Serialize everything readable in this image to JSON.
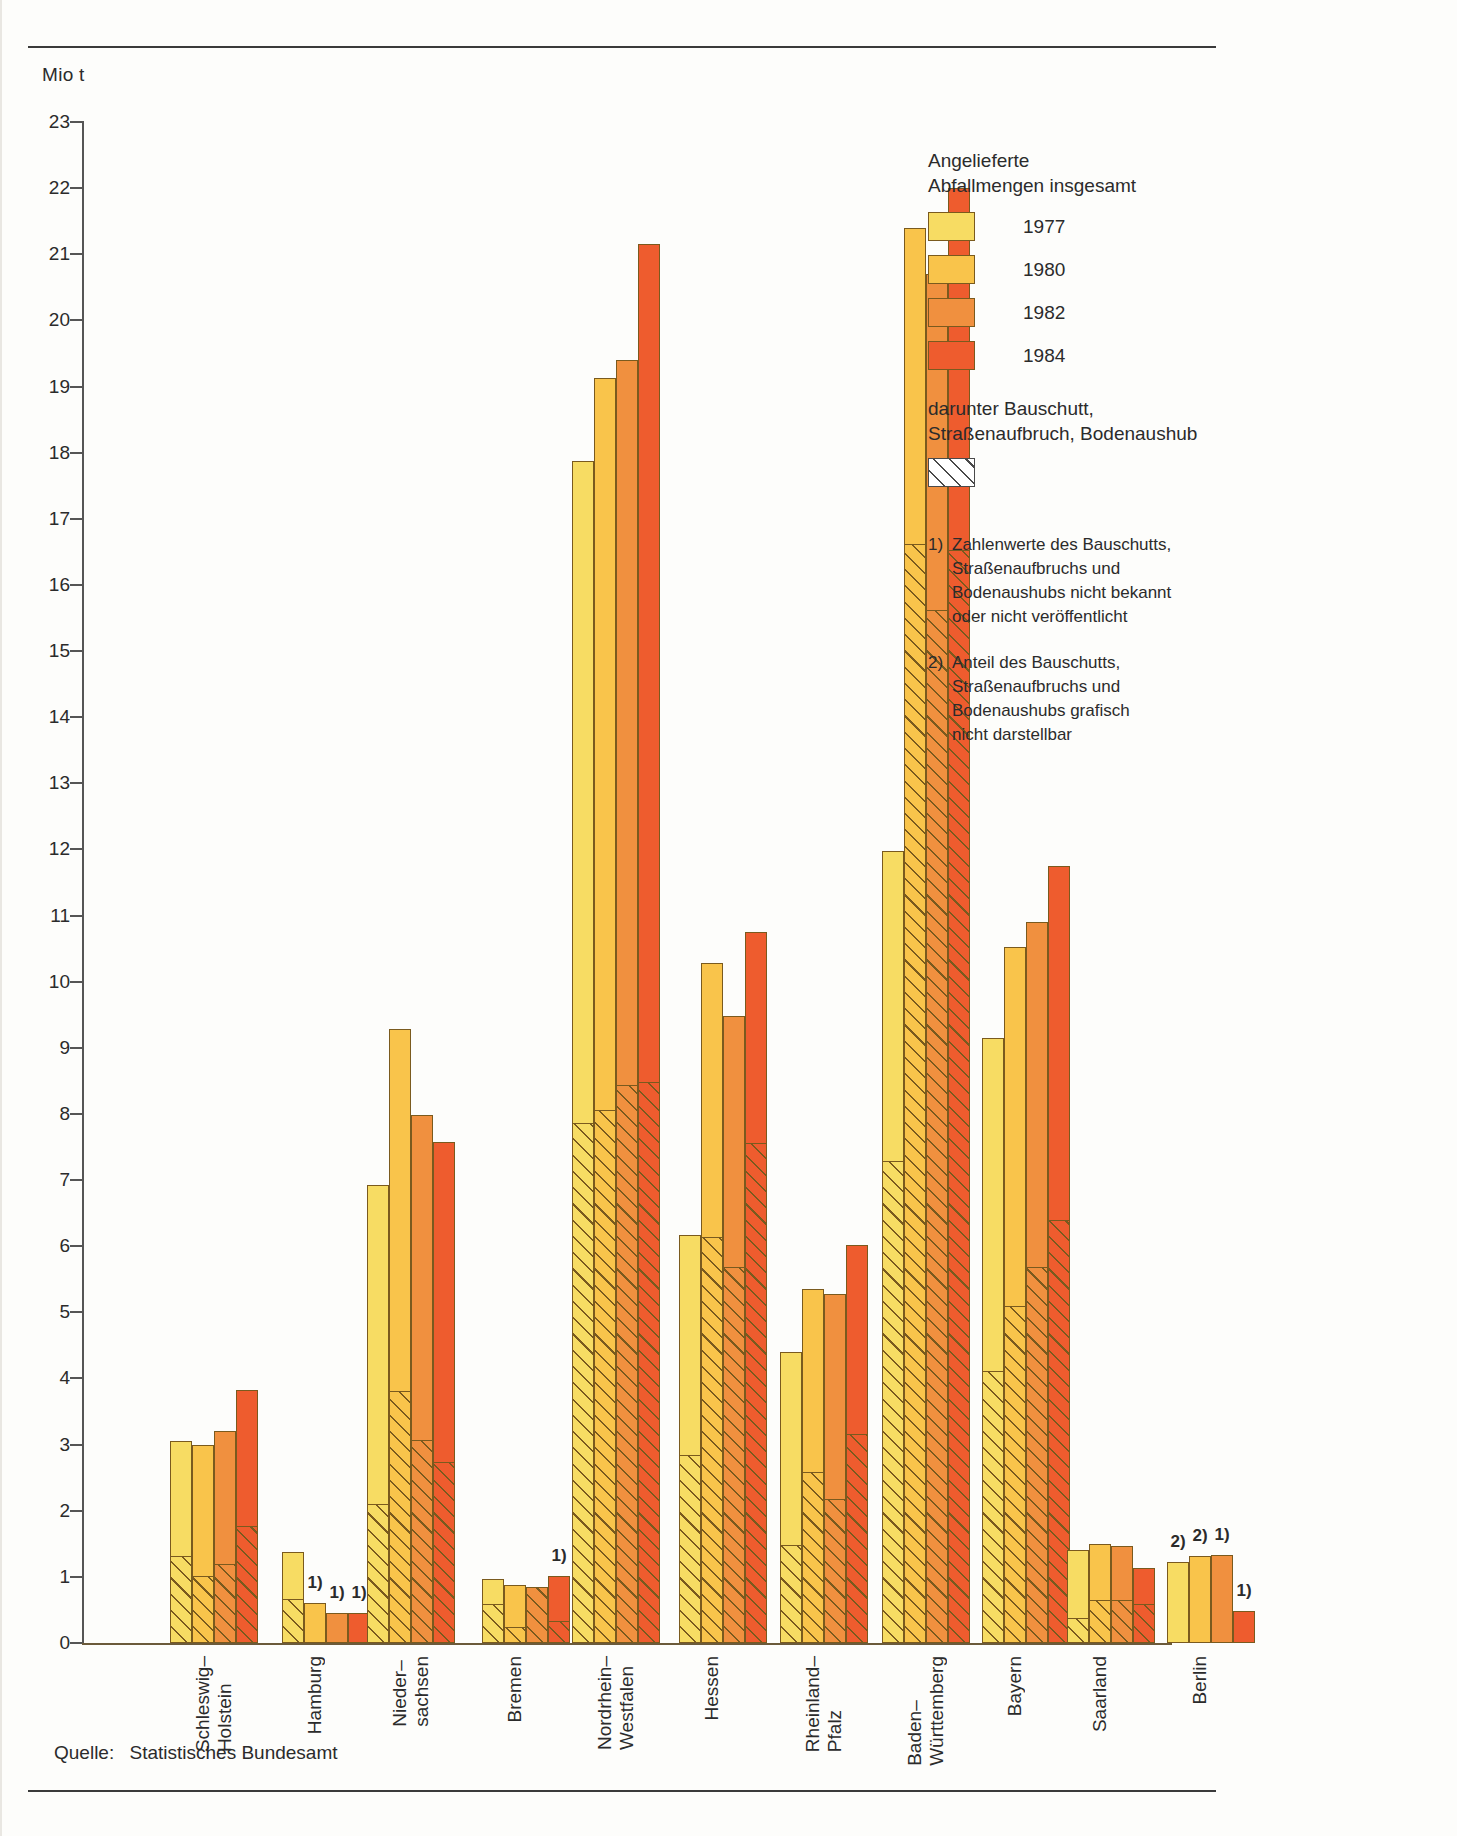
{
  "unit_label": "Mio t",
  "source": {
    "label": "Quelle:",
    "value": "Statistisches Bundesamt"
  },
  "legend": {
    "title": "Angelieferte\nAbfallmengen insgesamt",
    "series": [
      {
        "year": "1977",
        "color": "#F8DE63"
      },
      {
        "year": "1980",
        "color": "#F8C council"
      },
      {
        "year": "1982",
        "color": "#F08A3C"
      },
      {
        "year": "1984",
        "color": "#EE5B2E"
      }
    ],
    "hatch_title": "darunter Bauschutt,\nStraßenaufbruch, Bodenaushub",
    "notes": [
      {
        "num": "1)",
        "text": "Zahlenwerte des Bauschutts,\nStraßenaufbruchs und\nBodenaushubs nicht bekannt\noder nicht veröffentlicht"
      },
      {
        "num": "2)",
        "text": "Anteil des Bauschutts,\nStraßenaufbruchs und\nBodenaushubs grafisch\nnicht darstellbar"
      }
    ]
  },
  "chart_data": {
    "type": "bar",
    "title": "Angelieferte Abfallmengen insgesamt",
    "xlabel": "",
    "ylabel": "Mio t",
    "ylim": [
      0,
      23
    ],
    "yticks": [
      0,
      1,
      2,
      3,
      4,
      5,
      6,
      7,
      8,
      9,
      10,
      11,
      12,
      13,
      14,
      15,
      16,
      17,
      18,
      19,
      20,
      21,
      22,
      23
    ],
    "grid": false,
    "legend_position": "right",
    "categories": [
      "Schleswig–\nHolstein",
      "Hamburg",
      "Nieder–\nsachsen",
      "Bremen",
      "Nordrhein–\nWestfalen",
      "Hessen",
      "Rheinland–\nPfalz",
      "Baden–\nWürttemberg",
      "Bayern",
      "Saarland",
      "Berlin"
    ],
    "series": [
      {
        "name": "1977",
        "values": [
          3.05,
          1.38,
          6.92,
          0.97,
          17.88,
          6.17,
          4.4,
          11.97,
          9.15,
          1.41,
          1.22
        ]
      },
      {
        "name": "1980",
        "values": [
          3.0,
          0.6,
          9.28,
          0.88,
          19.13,
          10.28,
          5.35,
          21.4,
          10.53,
          1.5,
          1.32
        ]
      },
      {
        "name": "1982",
        "values": [
          3.2,
          0.45,
          7.98,
          0.85,
          19.4,
          9.48,
          5.28,
          20.7,
          10.9,
          1.47,
          1.33
        ]
      },
      {
        "name": "1984",
        "values": [
          3.82,
          0.45,
          7.58,
          1.02,
          21.15,
          10.75,
          6.02,
          22.0,
          11.75,
          1.13,
          0.48
        ]
      }
    ],
    "hatched_series": [
      {
        "name": "1977",
        "values": [
          1.3,
          0.65,
          2.08,
          0.57,
          7.85,
          2.83,
          1.47,
          7.27,
          4.1,
          0.37,
          null
        ]
      },
      {
        "name": "1980",
        "values": [
          1.0,
          null,
          3.8,
          0.22,
          8.05,
          6.13,
          2.57,
          16.6,
          5.08,
          0.63,
          null
        ]
      },
      {
        "name": "1982",
        "values": [
          1.18,
          null,
          3.05,
          0.83,
          8.42,
          5.67,
          2.17,
          15.6,
          5.67,
          0.63,
          null
        ]
      },
      {
        "name": "1984",
        "values": [
          1.75,
          null,
          2.72,
          0.32,
          8.47,
          7.55,
          3.15,
          16.52,
          6.38,
          0.57,
          null
        ]
      }
    ],
    "footnote_marks": {
      "Hamburg": {
        "1980": "1)",
        "1982": "1)",
        "1984": "1)"
      },
      "Bremen": {
        "1984": "1)"
      },
      "Berlin": {
        "1977": "2)",
        "1980": "2)",
        "1982": "1)",
        "1984": "1)"
      }
    }
  }
}
